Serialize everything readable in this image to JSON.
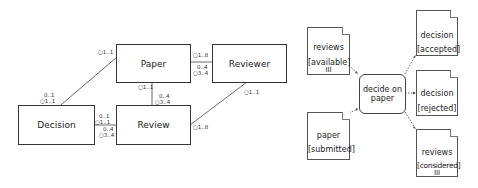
{
  "class_diagram": {
    "classes": [
      {
        "id": "paper",
        "label": "Paper"
      },
      {
        "id": "reviewer",
        "label": "Reviewer"
      },
      {
        "id": "decision",
        "label": "Decision"
      },
      {
        "id": "review",
        "label": "Review"
      }
    ],
    "multiplicities": {
      "decision_paper_at_paper": [
        "1..1"
      ],
      "decision_paper_at_decision": [
        "0..1",
        "1..1"
      ],
      "decision_review_top": [
        "0..1",
        "1..1"
      ],
      "decision_review_bottom": [
        "0..4",
        "3..4"
      ],
      "paper_review_left": [
        "1..1",
        "1..1"
      ],
      "paper_review_right": [
        "0..4",
        "3..4"
      ],
      "paper_reviewer_top": [
        "1..8",
        "1..8"
      ],
      "paper_reviewer_bottom": [
        "0..4",
        "3..4"
      ],
      "reviewer_review_at_reviewer": [
        "1..1"
      ],
      "reviewer_review_at_review": [
        "1..8"
      ]
    }
  },
  "activity_diagram": {
    "action": {
      "label_line1": "decide on",
      "label_line2": "paper"
    },
    "inputs": [
      {
        "name": "reviews",
        "state": "[available]",
        "marker": "III"
      },
      {
        "name": "paper",
        "state": "[submitted]",
        "marker": ""
      }
    ],
    "outputs": [
      {
        "name": "decision",
        "state": "[accepted]",
        "marker": ""
      },
      {
        "name": "decision",
        "state": "[rejected]",
        "marker": ""
      },
      {
        "name": "reviews",
        "state": "[considered]",
        "marker": "III"
      }
    ]
  }
}
